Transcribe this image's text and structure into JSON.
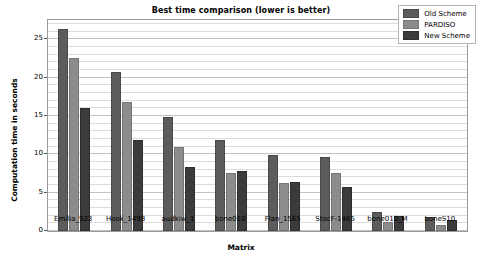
{
  "chart_data": {
    "type": "bar",
    "title": "Best time comparison (lower is better)",
    "xlabel": "Matrix",
    "ylabel": "Computation time in seconds",
    "categories": [
      "Emilia_923",
      "Hook_1498",
      "audkiw_1",
      "bone010",
      "Flan_1565",
      "StocF-1465",
      "bone010_M",
      "boneS10"
    ],
    "series": [
      {
        "name": "Old Scheme",
        "color": "#5c5c5c",
        "values": [
          26.3,
          20.7,
          14.8,
          11.9,
          9.9,
          9.7,
          2.5,
          1.8
        ]
      },
      {
        "name": "PARDISO",
        "color": "#8c8c8c",
        "values": [
          22.6,
          16.8,
          11.0,
          7.6,
          6.3,
          7.5,
          1.2,
          0.8
        ]
      },
      {
        "name": "New Scheme",
        "color": "#3b3b3b",
        "values": [
          16.0,
          11.8,
          8.4,
          7.8,
          6.4,
          5.8,
          1.9,
          1.5
        ]
      }
    ],
    "ylim": [
      0,
      27.5
    ],
    "yticks": [
      0,
      5,
      10,
      15,
      20,
      25
    ],
    "ytick_labels": [
      "0",
      "5",
      "10",
      "15",
      "20",
      "25"
    ],
    "grid": true,
    "grid_minor_step": 1,
    "legend_position": "upper right"
  }
}
